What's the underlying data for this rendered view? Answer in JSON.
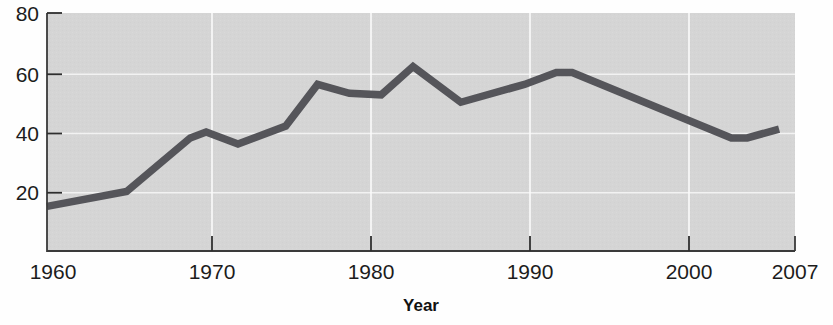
{
  "chart_data": {
    "type": "line",
    "title": "",
    "subtitle": "",
    "xlabel": "Year",
    "ylabel": "",
    "xlim": [
      1960,
      2007
    ],
    "ylim": [
      0,
      80
    ],
    "grid": true,
    "legend": null,
    "x_ticks": [
      "1960",
      "1970",
      "1980",
      "1990",
      "2000",
      "2007"
    ],
    "x_tick_values": [
      1960,
      1970,
      1980,
      1990,
      2000,
      2007
    ],
    "y_ticks": [
      "20",
      "40",
      "60",
      "80"
    ],
    "y_tick_values": [
      20,
      40,
      60,
      80
    ],
    "series": [
      {
        "name": "series-1",
        "color": "#55555a",
        "x": [
          1960,
          1965,
          1969,
          1970,
          1972,
          1975,
          1977,
          1979,
          1981,
          1983,
          1986,
          1990,
          1992,
          1993,
          2003,
          2004,
          2006
        ],
        "values": [
          15,
          20,
          38,
          40,
          36,
          42,
          56,
          53,
          52.5,
          62,
          50,
          56,
          60,
          60,
          38,
          38,
          41
        ]
      }
    ]
  },
  "axes": {
    "x_title": "Year"
  },
  "colors": {
    "plot_background": "#d5d5d5",
    "line": "#55555a",
    "gridline": "#f2f2f2",
    "axis": "#3a3a3a",
    "page_background": "#fefefe"
  }
}
